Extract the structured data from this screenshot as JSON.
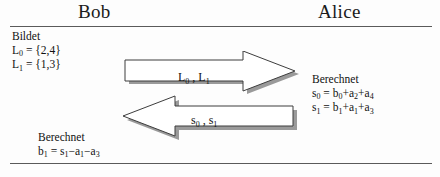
{
  "diagram": {
    "parties": {
      "left": {
        "name": "Bob"
      },
      "right": {
        "name": "Alice"
      }
    },
    "bob": {
      "compute": {
        "heading": "Bildet",
        "line1": "L0 = {2,4}",
        "line2": "L1 = {1,3}",
        "line1_parts": {
          "sym": "L",
          "idx": "0",
          "rest": " = {2,4}"
        },
        "line2_parts": {
          "sym": "L",
          "idx": "1",
          "rest": " = {1,3}"
        }
      },
      "verify": {
        "heading": "Berechnet",
        "formula": "b1 = s1−a1−a3",
        "parts": {
          "lhs_sym": "b",
          "lhs_idx": "1",
          "eq": " = ",
          "t1_sym": "s",
          "t1_idx": "1",
          "op1": "−",
          "t2_sym": "a",
          "t2_idx": "1",
          "op2": "−",
          "t3_sym": "a",
          "t3_idx": "3"
        }
      }
    },
    "alice": {
      "compute": {
        "heading": "Berechnet",
        "formula1": "s0 = b0+a2+a4",
        "formula2": "s1 = b1+a1+a3",
        "f1_parts": {
          "lhs_sym": "s",
          "lhs_idx": "0",
          "eq": " = ",
          "t1_sym": "b",
          "t1_idx": "0",
          "op1": "+",
          "t2_sym": "a",
          "t2_idx": "2",
          "op2": "+",
          "t3_sym": "a",
          "t3_idx": "4"
        },
        "f2_parts": {
          "lhs_sym": "s",
          "lhs_idx": "1",
          "eq": " = ",
          "t1_sym": "b",
          "t1_idx": "1",
          "op1": "+",
          "t2_sym": "a",
          "t2_idx": "1",
          "op2": "+",
          "t3_sym": "a",
          "t3_idx": "3"
        }
      }
    },
    "messages": [
      {
        "id": "bob-to-alice",
        "direction": "right",
        "label": "L0 , L1",
        "label_parts": {
          "sym1": "L",
          "idx1": "0",
          "sep": " , ",
          "sym2": "L",
          "idx2": "1"
        }
      },
      {
        "id": "alice-to-bob",
        "direction": "left",
        "label": "s0 , s1",
        "label_parts": {
          "sym1": "s",
          "idx1": "0",
          "sep": " , ",
          "sym2": "s",
          "idx2": "1"
        }
      }
    ],
    "colors": {
      "ink": "#111111",
      "rule": "#5a5a5a",
      "arrow_outline": "#3d3d3d",
      "arrow_fill": "#ffffff",
      "arrow_shadow": "#9a9a9a",
      "background": "#fdfdfd"
    }
  }
}
